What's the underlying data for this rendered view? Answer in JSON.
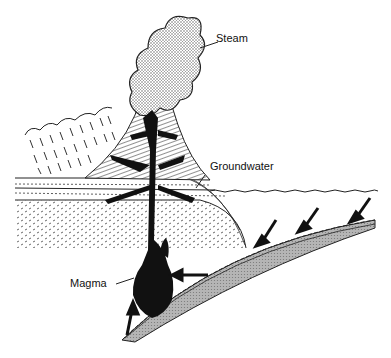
{
  "diagram": {
    "title": "",
    "labels": {
      "steam": "Steam",
      "groundwater": "Groundwater",
      "magma": "Magma"
    },
    "colors": {
      "ink": "#111111",
      "stipple": "#bdbdbd",
      "plate": "#a8a8a8",
      "background": "#ffffff"
    }
  }
}
